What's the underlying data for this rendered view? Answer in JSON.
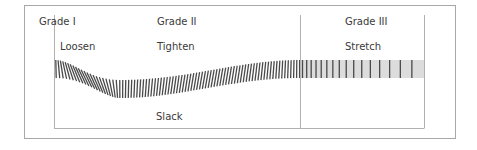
{
  "diagram": {
    "grades": [
      {
        "label": "Grade I"
      },
      {
        "label": "Grade II"
      },
      {
        "label": "Grade III"
      }
    ],
    "phases": [
      {
        "label": "Loosen"
      },
      {
        "label": "Tighten"
      },
      {
        "label": "Stretch"
      },
      {
        "label": "Slack"
      }
    ],
    "colors": {
      "frame": "#a8a8a8",
      "axis": "#b0b0b0",
      "stripe": "#4a4a4a",
      "band": "#dcdcdc",
      "text": "#3a3a3a"
    }
  }
}
